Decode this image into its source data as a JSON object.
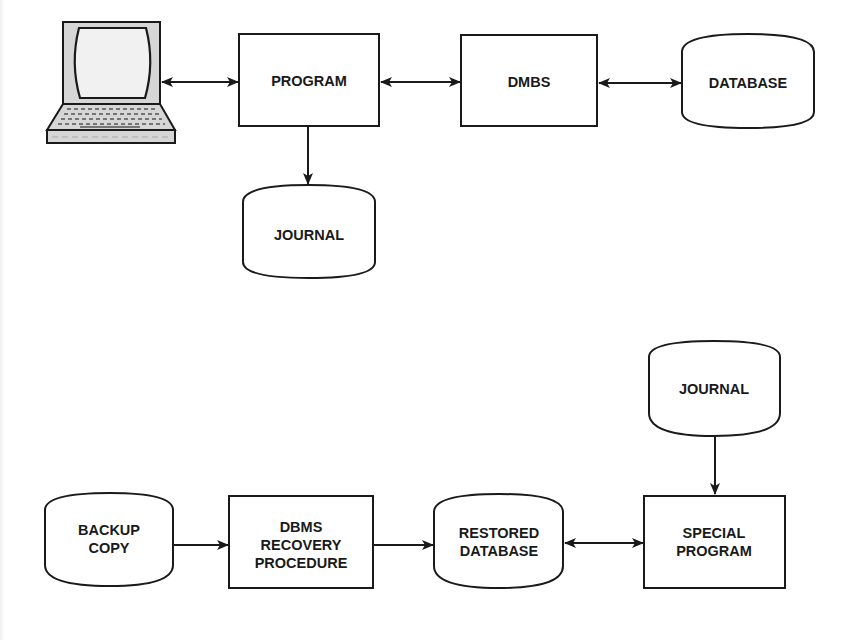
{
  "diagram": {
    "type": "flowchart",
    "colors": {
      "stroke": "#1a1a1a",
      "fill": "#ffffff",
      "terminal_fill": "#d9d9d9",
      "text": "#1a1a1a"
    },
    "top": {
      "nodes": {
        "terminal": {
          "shape": "computer-terminal",
          "label": ""
        },
        "program": {
          "shape": "rectangle",
          "label": "PROGRAM"
        },
        "dmbs": {
          "shape": "rectangle",
          "label": "DMBS"
        },
        "database": {
          "shape": "cylinder",
          "label": "DATABASE"
        },
        "journal": {
          "shape": "cylinder",
          "label": "JOURNAL"
        }
      },
      "edges": [
        {
          "from": "terminal",
          "to": "program",
          "direction": "both"
        },
        {
          "from": "program",
          "to": "dmbs",
          "direction": "both"
        },
        {
          "from": "dmbs",
          "to": "database",
          "direction": "both"
        },
        {
          "from": "program",
          "to": "journal",
          "direction": "forward"
        }
      ]
    },
    "bottom": {
      "nodes": {
        "backup": {
          "shape": "cylinder",
          "label_lines": [
            "BACKUP",
            "COPY"
          ]
        },
        "recovery": {
          "shape": "rectangle",
          "label_lines": [
            "DBMS",
            "RECOVERY",
            "PROCEDURE"
          ]
        },
        "restored": {
          "shape": "cylinder",
          "label_lines": [
            "RESTORED",
            "DATABASE"
          ]
        },
        "special": {
          "shape": "rectangle",
          "label_lines": [
            "SPECIAL",
            "PROGRAM"
          ]
        },
        "journal": {
          "shape": "cylinder",
          "label": "JOURNAL"
        }
      },
      "edges": [
        {
          "from": "backup",
          "to": "recovery",
          "direction": "forward"
        },
        {
          "from": "recovery",
          "to": "restored",
          "direction": "forward"
        },
        {
          "from": "restored",
          "to": "special",
          "direction": "both"
        },
        {
          "from": "journal",
          "to": "special",
          "direction": "forward"
        }
      ]
    }
  }
}
